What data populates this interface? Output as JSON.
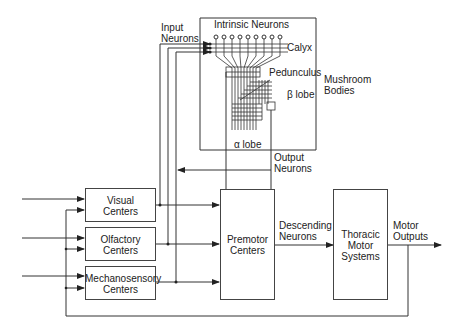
{
  "diagram": {
    "mushroom_bodies": {
      "label_line1": "Mushroom",
      "label_line2": "Bodies",
      "intrinsic_neurons": "Intrinsic Neurons",
      "calyx": "Calyx",
      "pedunculus": "Pedunculus",
      "beta_lobe": "β lobe",
      "alpha_lobe": "α lobe"
    },
    "input_neurons": {
      "line1": "Input",
      "line2": "Neurons"
    },
    "output_neurons": {
      "line1": "Output",
      "line2": "Neurons"
    },
    "boxes": {
      "visual": {
        "line1": "Visual",
        "line2": "Centers"
      },
      "olfactory": {
        "line1": "Olfactory",
        "line2": "Centers"
      },
      "mechanosensory": {
        "line1": "Mechanosensory",
        "line2": "Centers"
      },
      "premotor": {
        "line1": "Premotor",
        "line2": "Centers"
      },
      "thoracic": {
        "line1": "Thoracic",
        "line2": "Motor",
        "line3": "Systems"
      }
    },
    "descending_neurons": {
      "line1": "Descending",
      "line2": "Neurons"
    },
    "motor_outputs": {
      "line1": "Motor",
      "line2": "Outputs"
    },
    "colors": {
      "line": "#333333",
      "background": "#ffffff"
    }
  }
}
